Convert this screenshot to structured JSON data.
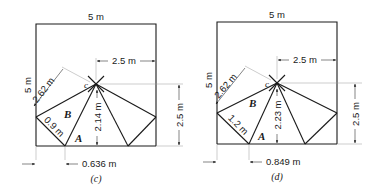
{
  "figure": {
    "panels": [
      {
        "id": "c",
        "caption": "(c)",
        "top_width": "5 m",
        "left_height": "5 m",
        "half_width": "2.5 m",
        "slant_length": "2.62 m",
        "short_member": "0.9 m",
        "vertical_height": "2.14 m",
        "right_height": "2.5 m",
        "offset": "0.636 m",
        "label_point": "c",
        "label_B": "B",
        "label_A": "A"
      },
      {
        "id": "d",
        "caption": "(d)",
        "top_width": "5 m",
        "left_height": "5 m",
        "half_width": "2.5 m",
        "slant_length": "2.62 m",
        "short_member": "1.2 m",
        "vertical_height": "2.23 m",
        "right_height": "2.5 m",
        "offset": "0.849 m",
        "label_point": "c",
        "label_B": "B",
        "label_A": "A"
      }
    ]
  }
}
